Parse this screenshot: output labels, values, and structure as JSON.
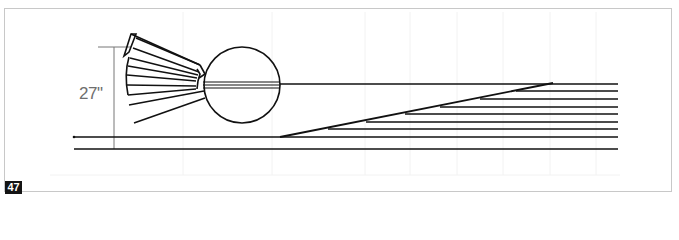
{
  "figure": {
    "number": "47",
    "dimension_label": "27\"",
    "colors": {
      "line": "#111111",
      "dimension": "#777777",
      "frame": "#c8c8c8",
      "badge_bg": "#141414",
      "badge_text": "#ffffff"
    },
    "elements": {
      "turntable": "circle",
      "roundhouse_stalls": 7,
      "radial_tracks": 2,
      "yard_ladder_tracks": 9,
      "main_tracks": 2
    }
  }
}
